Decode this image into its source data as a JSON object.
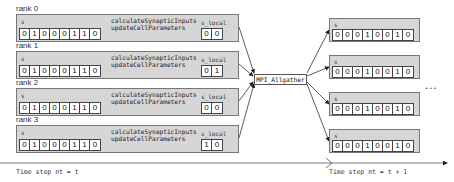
{
  "diagram": {
    "ranks": [
      {
        "label": "rank 0",
        "s_label": "s",
        "s_bits": [
          "0",
          "1",
          "0",
          "0",
          "0",
          "1",
          "1",
          "0"
        ],
        "fn1": "calculateSynapticInputs",
        "fn2": "updateCellParameters",
        "s_local_label": "s_local",
        "s_local_bits": [
          "0",
          "0"
        ]
      },
      {
        "label": "rank 1",
        "s_label": "s",
        "s_bits": [
          "0",
          "1",
          "0",
          "0",
          "0",
          "1",
          "1",
          "0"
        ],
        "fn1": "calculateSynapticInputs",
        "fn2": "updateCellParameters",
        "s_local_label": "s_local",
        "s_local_bits": [
          "0",
          "1"
        ]
      },
      {
        "label": "rank 2",
        "s_label": "s",
        "s_bits": [
          "0",
          "1",
          "0",
          "0",
          "0",
          "1",
          "1",
          "0"
        ],
        "fn1": "calculateSynapticInputs",
        "fn2": "updateCellParameters",
        "s_local_label": "s_local",
        "s_local_bits": [
          "0",
          "0"
        ]
      },
      {
        "label": "rank 3",
        "s_label": "s",
        "s_bits": [
          "0",
          "1",
          "0",
          "0",
          "0",
          "1",
          "1",
          "0"
        ],
        "fn1": "calculateSynapticInputs",
        "fn2": "updateCellParameters",
        "s_local_label": "s_local",
        "s_local_bits": [
          "1",
          "0"
        ]
      }
    ],
    "gather": {
      "label": "MPI_Allgather"
    },
    "results": [
      {
        "s_label": "s",
        "s_bits": [
          "0",
          "0",
          "0",
          "1",
          "0",
          "0",
          "1",
          "0"
        ]
      },
      {
        "s_label": "s",
        "s_bits": [
          "0",
          "0",
          "0",
          "1",
          "0",
          "0",
          "1",
          "0"
        ]
      },
      {
        "s_label": "s",
        "s_bits": [
          "0",
          "0",
          "0",
          "1",
          "0",
          "0",
          "1",
          "0"
        ]
      },
      {
        "s_label": "s",
        "s_bits": [
          "0",
          "0",
          "0",
          "1",
          "0",
          "0",
          "1",
          "0"
        ]
      }
    ],
    "ellipsis": "...",
    "time_left": "Time step nt = t",
    "time_right": "Time step nt = t + 1"
  }
}
